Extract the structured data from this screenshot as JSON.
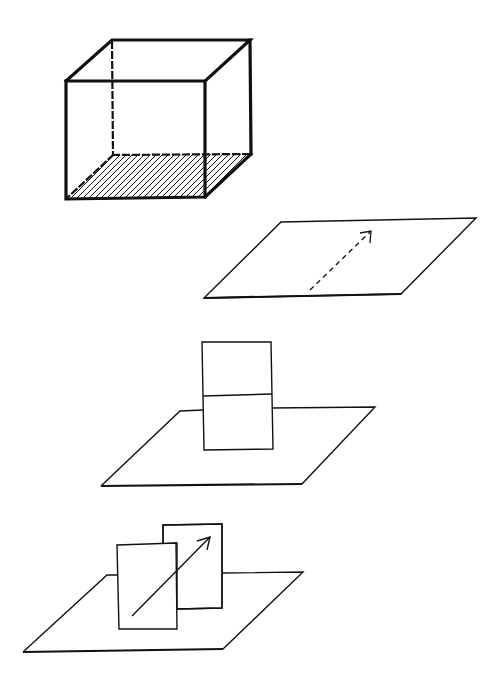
{
  "colors": {
    "stroke": "#111111",
    "background": "#ffffff"
  },
  "figures": [
    {
      "id": "cube",
      "description": "Cube drawn with heavy outline, hidden edges dashed, bottom face hatched",
      "front_face": [
        [
          66,
          81
        ],
        [
          205,
          81
        ],
        [
          205,
          197
        ],
        [
          66,
          199
        ]
      ],
      "back_top": [
        [
          112,
          40
        ],
        [
          250,
          40
        ]
      ],
      "back_right_edge": [
        [
          250,
          40
        ],
        [
          251,
          154
        ]
      ],
      "hidden_edges": [
        [
          [
            112,
            40
          ],
          [
            113,
            155
          ]
        ],
        [
          [
            113,
            155
          ],
          [
            251,
            154
          ]
        ],
        [
          [
            113,
            155
          ],
          [
            66,
            199
          ]
        ]
      ],
      "hatch_spacing": 6
    },
    {
      "id": "plane-with-dashed-arrow",
      "plane": [
        [
          204,
          298
        ],
        [
          401,
          294
        ],
        [
          476,
          218
        ],
        [
          281,
          222
        ]
      ],
      "arrow": {
        "from": [
          310,
          290
        ],
        "to": [
          371,
          231
        ],
        "dashed": true
      }
    },
    {
      "id": "plane-with-vertical-rectangle",
      "plane": [
        [
          101,
          486
        ],
        [
          302,
          484
        ],
        [
          375,
          407
        ],
        [
          180,
          411
        ]
      ],
      "rect": {
        "tl": [
          202,
          342
        ],
        "tr": [
          271,
          342
        ],
        "br": [
          273,
          449
        ],
        "bl": [
          204,
          450
        ],
        "mid_y_left": 396,
        "mid_y_right": 394
      }
    },
    {
      "id": "plane-with-two-rectangles-and-arrow",
      "plane": [
        [
          23,
          652
        ],
        [
          223,
          649
        ],
        [
          303,
          572
        ],
        [
          107,
          575
        ]
      ],
      "back_rect": {
        "tl": [
          163,
          525
        ],
        "tr": [
          222,
          524
        ],
        "br": [
          222,
          608
        ],
        "bl": [
          177,
          609
        ]
      },
      "front_rect": {
        "tl": [
          117,
          545
        ],
        "tr": [
          176,
          543
        ],
        "br": [
          177,
          629
        ],
        "bl": [
          119,
          629
        ]
      },
      "arrow": {
        "from": [
          132,
          616
        ],
        "to": [
          210,
          537
        ],
        "dashed": false
      }
    }
  ]
}
